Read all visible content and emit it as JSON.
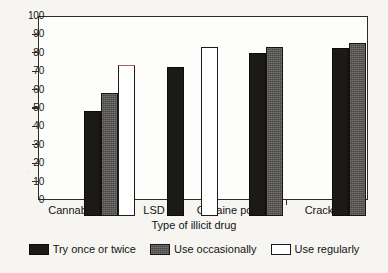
{
  "chart_data": {
    "type": "bar",
    "title": "",
    "xlabel": "Type of illicit drug",
    "ylabel": "",
    "categories": [
      "Cannabis",
      "LSD",
      "Cocaine powder",
      "Crack"
    ],
    "series": [
      {
        "name": "Try once or twice",
        "color": "#1c1a17",
        "values": [
          57,
          81,
          88.5,
          91.5
        ]
      },
      {
        "name": "Use occasionally",
        "color": "#575552",
        "values": [
          67,
          null,
          92,
          94
        ]
      },
      {
        "name": "Use regularly",
        "color": "#ffffff",
        "values": [
          82,
          92,
          null,
          null
        ]
      }
    ],
    "ylim": [
      0,
      100
    ],
    "ytick_labels": [
      "0",
      "10",
      "20",
      "30",
      "40",
      "50",
      "60",
      "70",
      "80",
      "90",
      "100"
    ],
    "ytick_values": [
      0,
      10,
      20,
      30,
      40,
      50,
      60,
      70,
      80,
      90,
      100
    ],
    "grid": false,
    "legend_position": "bottom",
    "frame": true
  },
  "legend": {
    "entries": [
      {
        "label": "Try once or twice",
        "swatch": "black-filled-swatch"
      },
      {
        "label": "Use occasionally",
        "swatch": "gray-filled-swatch"
      },
      {
        "label": "Use regularly",
        "swatch": "white-outlined-swatch"
      }
    ]
  }
}
